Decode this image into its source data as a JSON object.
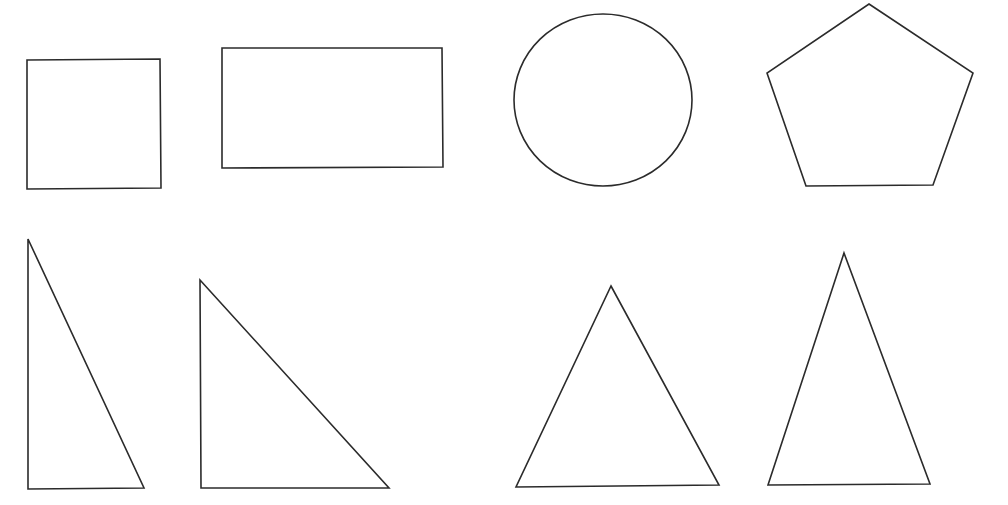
{
  "canvas": {
    "width": 1008,
    "height": 505,
    "background": "#ffffff",
    "stroke_color": "#2b2b2b"
  },
  "shapes": [
    {
      "id": "square",
      "label": "square",
      "type": "polygon",
      "points": "27,60 160,59 161,188 27,189"
    },
    {
      "id": "rectangle",
      "label": "rectangle",
      "type": "polygon",
      "points": "222,48 442,48 443,167 222,168"
    },
    {
      "id": "circle",
      "label": "circle",
      "type": "ellipse",
      "cx": 603,
      "cy": 100,
      "rx": 89,
      "ry": 86
    },
    {
      "id": "pentagon",
      "label": "pentagon",
      "type": "polygon",
      "points": "869,4 973,73 933,185 806,186 767,73"
    },
    {
      "id": "right-triangle-tall",
      "label": "right triangle (tall)",
      "type": "polygon",
      "points": "28,239 144,488 28,489"
    },
    {
      "id": "right-triangle-wide",
      "label": "right triangle (wide)",
      "type": "polygon",
      "points": "200,280 389,488 201,488"
    },
    {
      "id": "equilateral-triangle",
      "label": "equilateral triangle",
      "type": "polygon",
      "points": "611,286 719,485 516,487"
    },
    {
      "id": "isosceles-triangle",
      "label": "isosceles triangle",
      "type": "polygon",
      "points": "844,253 930,484 768,485"
    }
  ]
}
